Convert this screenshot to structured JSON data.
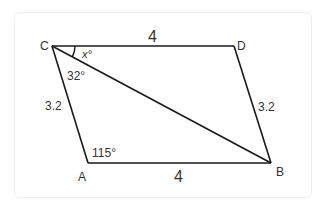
{
  "diagram": {
    "type": "parallelogram",
    "vertices": {
      "C": {
        "label": "C",
        "x": 52,
        "y": 46
      },
      "D": {
        "label": "D",
        "x": 234,
        "y": 46
      },
      "A": {
        "label": "A",
        "x": 88,
        "y": 163
      },
      "B": {
        "label": "B",
        "x": 271,
        "y": 163
      }
    },
    "diagonal": [
      "C",
      "B"
    ],
    "side_labels": {
      "CD": "4",
      "AB": "4",
      "CA": "3.2",
      "DB": "3.2"
    },
    "angle_labels": {
      "DCB": "x°",
      "ACB": "32°",
      "CAB": "115°"
    },
    "colors": {
      "line": "#1a1a1a",
      "text": "#333333",
      "card_border": "#eeeeee"
    }
  }
}
